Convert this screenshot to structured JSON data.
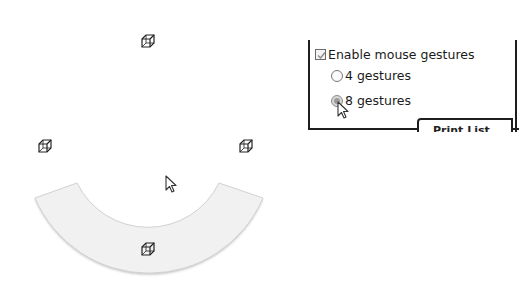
{
  "gesture_ring": {
    "segments": 4,
    "highlighted_segment": "bottom",
    "highlight_color": "#f0f0f0",
    "items": [
      {
        "position": "top",
        "icon": "cube-icon"
      },
      {
        "position": "left",
        "icon": "cube-icon"
      },
      {
        "position": "right",
        "icon": "cube-icon"
      },
      {
        "position": "bottom",
        "icon": "cube-icon"
      }
    ],
    "cursor": "arrow-pointer-icon"
  },
  "options_panel": {
    "enable_checkbox": {
      "label": "Enable mouse gestures",
      "checked": true
    },
    "radio_options": [
      {
        "label": "4 gestures",
        "selected": false
      },
      {
        "label": "8 gestures",
        "selected": true
      }
    ],
    "partial_button_label": "Print List",
    "cursor": "arrow-pointer-icon"
  }
}
